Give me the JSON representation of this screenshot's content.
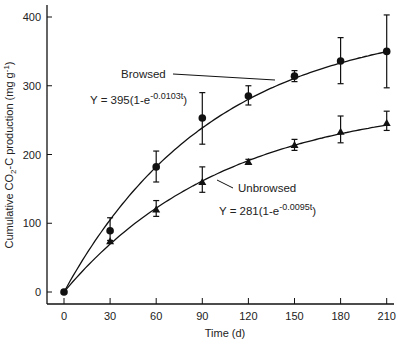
{
  "chart_data": {
    "type": "line",
    "title": "",
    "xlabel": "Time (d)",
    "ylabel": "Cumulative CO2-C production (mg g-1)",
    "x": [
      0,
      30,
      60,
      90,
      120,
      150,
      180,
      210
    ],
    "xticks": [
      "0",
      "30",
      "60",
      "90",
      "120",
      "150",
      "180",
      "210"
    ],
    "yticks": [
      "0",
      "100",
      "200",
      "300",
      "400"
    ],
    "xlim": [
      0,
      210
    ],
    "ylim": [
      -20,
      420
    ],
    "grid": false,
    "legend": "none (inline annotations)",
    "series": [
      {
        "name": "Browsed",
        "marker": "circle",
        "values": [
          0,
          89,
          182,
          253,
          285,
          314,
          336,
          350
        ],
        "err_low": [
          0,
          75,
          160,
          215,
          272,
          306,
          303,
          297
        ],
        "err_high": [
          0,
          108,
          205,
          290,
          300,
          322,
          370,
          403
        ],
        "fit": {
          "a": 395,
          "k": 0.0103
        },
        "equation": "Y = 395(1-e-0.0103t)"
      },
      {
        "name": "Unbrowsed",
        "marker": "triangle",
        "values": [
          0,
          74,
          120,
          160,
          189,
          214,
          233,
          246
        ],
        "err_low": [
          0,
          74,
          110,
          145,
          186,
          206,
          217,
          235
        ],
        "err_high": [
          0,
          74,
          133,
          182,
          193,
          222,
          256,
          263
        ],
        "fit": {
          "a": 281,
          "k": 0.0095
        },
        "equation": "Y = 281(1-e-0.0095t)"
      }
    ],
    "annotations": [
      {
        "label": "Browsed",
        "eq_prefix": "Y = 395(1-e",
        "eq_exp": "-0.0103t",
        "eq_suffix": ")"
      },
      {
        "label": "Unbrowsed",
        "eq_prefix": "Y = 281(1-e",
        "eq_exp": "-0.0095t",
        "eq_suffix": ")"
      }
    ],
    "axis_label_parts": {
      "y_main": "Cumulative CO",
      "y_sub": "2",
      "y_mid": "-C production (mg g",
      "y_sup": "-1",
      "y_end": ")"
    }
  },
  "colors": {
    "ink": "#111111",
    "background": "#ffffff"
  }
}
